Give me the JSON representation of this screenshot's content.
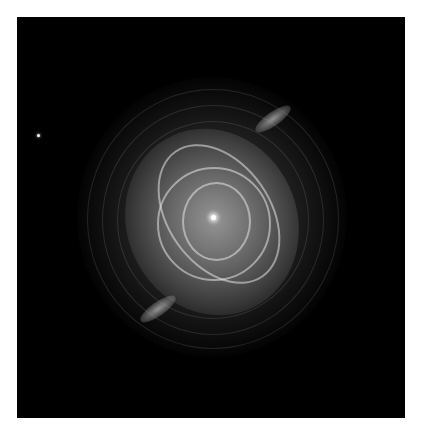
{
  "image": {
    "subject": "planetary nebula (Cat's Eye-like), grayscale",
    "background_color": "#000000",
    "border_color": "#ffffff"
  }
}
